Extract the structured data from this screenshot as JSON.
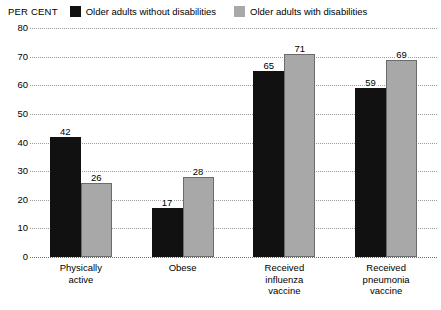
{
  "unit_label": "PER CENT",
  "legend": {
    "items": [
      {
        "label": "Older adults without disabilities",
        "color": "#111111",
        "swatch_name": "legend-swatch-without-disabilities"
      },
      {
        "label": "Older adults with disabilities",
        "color": "#a8a8a8",
        "swatch_name": "legend-swatch-with-disabilities"
      }
    ]
  },
  "chart_data": {
    "type": "bar",
    "title": "",
    "subtitle": "",
    "xlabel": "",
    "ylabel": "PER CENT",
    "ylim": [
      0,
      80
    ],
    "yticks": [
      0,
      10,
      20,
      30,
      40,
      50,
      60,
      70,
      80
    ],
    "ytick_labels": [
      "0",
      "10",
      "20",
      "30",
      "40",
      "50",
      "60",
      "70",
      "80"
    ],
    "grid": true,
    "grid_style": "dotted",
    "legend_position": "top",
    "categories": [
      "Physically\nactive",
      "Obese",
      "Received\ninfluenza\nvaccine",
      "Received\npneumonia\nvaccine"
    ],
    "series": [
      {
        "name": "Older adults without disabilities",
        "color": "#111111",
        "values": [
          42,
          17,
          65,
          59
        ],
        "value_labels": [
          "42",
          "17",
          "65",
          "59"
        ]
      },
      {
        "name": "Older adults with disabilities",
        "color": "#a8a8a8",
        "values": [
          26,
          28,
          71,
          69
        ],
        "value_labels": [
          "26",
          "28",
          "71",
          "69"
        ]
      }
    ]
  }
}
